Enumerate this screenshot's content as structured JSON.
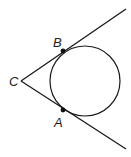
{
  "diagram": {
    "type": "geometry",
    "points": {
      "C": {
        "label": "C",
        "x": 21,
        "y": 81
      },
      "B": {
        "label": "B",
        "x": 63,
        "y": 51
      },
      "A": {
        "label": "A",
        "x": 63,
        "y": 110
      }
    },
    "circle": {
      "cx": 85,
      "cy": 81,
      "r": 35
    },
    "lines": [
      {
        "name": "tangent-CB",
        "x1": 21,
        "y1": 81,
        "x2": 126,
        "y2": 9
      },
      {
        "name": "tangent-CA",
        "x1": 21,
        "y1": 81,
        "x2": 126,
        "y2": 149
      }
    ],
    "colors": {
      "stroke": "#1a1a1a",
      "background": "#ffffff"
    }
  }
}
